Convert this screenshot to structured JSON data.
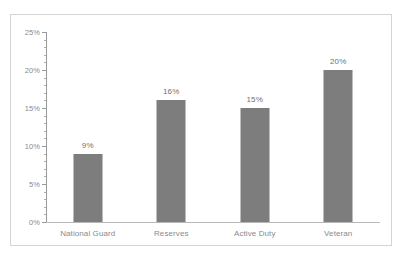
{
  "chart_data": {
    "type": "bar",
    "title": "",
    "subtitle": "",
    "xlabel": "",
    "ylabel": "",
    "categories": [
      "National Guard",
      "Reserves",
      "Active Duty",
      "Veteran"
    ],
    "values": [
      9,
      16,
      15,
      20
    ],
    "value_labels": [
      "9%",
      "16%",
      "15%",
      "20%"
    ],
    "ylim": [
      0,
      25
    ],
    "y_ticks": [
      0,
      5,
      10,
      15,
      20,
      25
    ],
    "y_tick_labels": [
      "0%",
      "5%",
      "10%",
      "15%",
      "20%",
      "25%"
    ],
    "y_minor_tick_interval": 1,
    "grid": false,
    "legend": false,
    "legend_position": "none",
    "bar_color": "#7d7d7d",
    "axis_color": "#9a9a9a",
    "border_color": "#d4d4d4",
    "text_color": "#8a8a8a"
  }
}
